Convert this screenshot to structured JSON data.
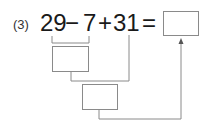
{
  "problem": {
    "number_label": "(3)",
    "terms": [
      "29",
      "−",
      "7",
      "+",
      "31",
      "="
    ],
    "step1_answer": "",
    "step2_answer": "",
    "final_answer": ""
  },
  "colors": {
    "line": "#8a8a8a",
    "text": "#1a1a1a"
  }
}
